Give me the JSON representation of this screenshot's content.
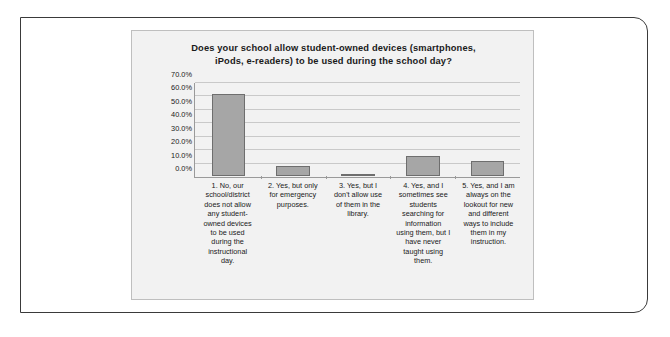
{
  "chart_data": {
    "type": "bar",
    "title": "Does your school allow student-owned devices (smartphones, iPods, e-readers) to be used during the school day?",
    "title_lines": [
      "Does your school allow student-owned devices (smartphones,",
      "iPods, e-readers) to be used during the school day?"
    ],
    "xlabel": "",
    "ylabel": "",
    "ylim": [
      0,
      70
    ],
    "ytick_labels": [
      "70.0%",
      "60.0%",
      "50.0%",
      "40.0%",
      "30.0%",
      "20.0%",
      "10.0%",
      "0.0%"
    ],
    "ytick_values": [
      70,
      60,
      50,
      40,
      30,
      20,
      10,
      0
    ],
    "grid": true,
    "legend": false,
    "bar_color": "#a6a6a6",
    "bar_border_color": "#6e6e6e",
    "plot_background": "#f2f2f2",
    "categories": [
      "1. No, our school/district does not allow any student-owned devices to be used during the instructional day.",
      "2. Yes, but only for emergency purposes.",
      "3. Yes, but I don't allow use of them in the library.",
      "4. Yes, and I sometimes see students searching for information using them, but I have never taught using them.",
      "5. Yes, and I am always on the lookout for new and different ways to include them in my instruction."
    ],
    "category_lines": [
      [
        "1. No, our",
        "school/district",
        "does not allow",
        "any student-",
        "owned devices",
        "to be used",
        "during the",
        "instructional",
        "day."
      ],
      [
        "2. Yes, but only",
        "for emergency",
        "purposes."
      ],
      [
        "3. Yes, but I",
        "don't allow use",
        "of them in the",
        "library."
      ],
      [
        "4. Yes, and I",
        "sometimes see",
        "students",
        "searching for",
        "information",
        "using them, but I",
        "have never",
        "taught using",
        "them."
      ],
      [
        "5. Yes, and I am",
        "always on the",
        "lookout for new",
        "and different",
        "ways to include",
        "them in my",
        "instruction."
      ]
    ],
    "values": [
      62,
      7.5,
      1,
      15,
      11
    ]
  }
}
